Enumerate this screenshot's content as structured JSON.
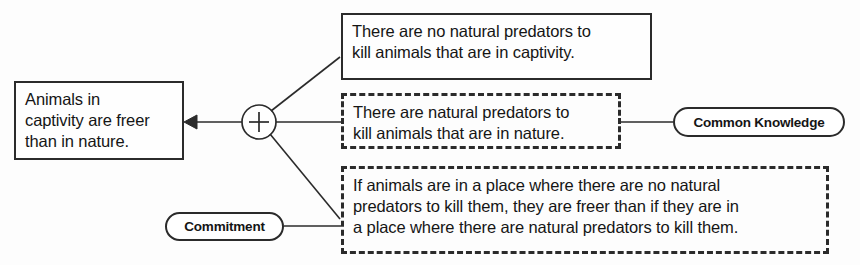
{
  "diagram": {
    "type": "argument-map",
    "colors": {
      "stroke": "#2b2b2b",
      "text": "#151515",
      "background": "#fdfdfd"
    },
    "conclusion": {
      "id": "conclusion",
      "style": "solid-box",
      "lines": [
        "Animals in",
        "captivity are freer",
        "than in nature."
      ],
      "text": "Animals in captivity are freer than in nature."
    },
    "inference_node": {
      "id": "convergence-node",
      "symbol": "+",
      "shape": "circle",
      "center": [
        259,
        122
      ],
      "radius": 17
    },
    "premises": [
      {
        "id": "premise-1",
        "style": "solid-box",
        "implicit": false,
        "lines": [
          "There are no natural predators to",
          "kill animals that are in captivity."
        ],
        "text": "There are no natural predators to kill animals that are in captivity."
      },
      {
        "id": "premise-2",
        "style": "dashed-box",
        "implicit": true,
        "lines": [
          "There are natural predators to",
          "kill animals that are in nature."
        ],
        "text": "There are natural predators to kill animals that are in nature."
      },
      {
        "id": "premise-3",
        "style": "dashed-box",
        "implicit": true,
        "lines": [
          "If animals are in a place where there are no natural",
          "predators to kill them, they are freer than if they are in",
          "a place where there are natural predators to kill them."
        ],
        "text": "If animals are in a place where there are no natural predators to kill them, they are freer than if they are in a place where there are natural predators to kill them."
      }
    ],
    "annotations": [
      {
        "id": "annotation-common-knowledge",
        "label": "Common Knowledge",
        "shape": "oval",
        "attached_to": "premise-2"
      },
      {
        "id": "annotation-commitment",
        "label": "Commitment",
        "shape": "oval",
        "attached_to": "premise-3"
      }
    ],
    "edges": [
      {
        "id": "edge-node-to-conclusion",
        "from": "convergence-node",
        "to": "conclusion",
        "arrowhead": true
      },
      {
        "id": "edge-premise-1-to-node",
        "from": "premise-1",
        "to": "convergence-node",
        "arrowhead": false
      },
      {
        "id": "edge-premise-2-to-node",
        "from": "premise-2",
        "to": "convergence-node",
        "arrowhead": false
      },
      {
        "id": "edge-premise-3-to-node",
        "from": "premise-3",
        "to": "convergence-node",
        "arrowhead": false
      },
      {
        "id": "edge-common-knowledge-to-premise-2",
        "from": "annotation-common-knowledge",
        "to": "premise-2",
        "arrowhead": false
      },
      {
        "id": "edge-commitment-to-premise-3",
        "from": "annotation-commitment",
        "to": "premise-3",
        "arrowhead": false
      }
    ]
  }
}
